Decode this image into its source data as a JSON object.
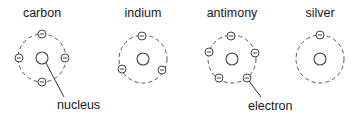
{
  "atoms": [
    {
      "name": "carbon",
      "label_x": 42,
      "cx": 42,
      "cy": 58,
      "r": 24,
      "electrons": [
        [
          42,
          34
        ],
        [
          19,
          58
        ],
        [
          65,
          58
        ],
        [
          42,
          82
        ]
      ]
    },
    {
      "name": "indium",
      "label_x": 143,
      "cx": 143,
      "cy": 59,
      "r": 24,
      "electrons": [
        [
          142,
          36
        ],
        [
          122,
          69
        ],
        [
          162,
          70
        ]
      ]
    },
    {
      "name": "antimony",
      "label_x": 232,
      "cx": 232,
      "cy": 59,
      "r": 24,
      "electrons": [
        [
          231,
          36
        ],
        [
          209,
          52
        ],
        [
          255,
          53
        ],
        [
          219,
          78
        ],
        [
          247,
          78
        ]
      ]
    },
    {
      "name": "silver",
      "label_x": 320,
      "cx": 320,
      "cy": 59,
      "r": 24,
      "electrons": [
        [
          320,
          35
        ]
      ]
    }
  ],
  "callouts": {
    "nucleus": {
      "text": "nucleus",
      "x": 57,
      "y": 109,
      "line": [
        46,
        63,
        64,
        97
      ]
    },
    "electron": {
      "text": "electron",
      "x": 248,
      "y": 110,
      "line": [
        249,
        81,
        261,
        97
      ]
    }
  },
  "nucleus_radius": 6,
  "electron_radius": 4
}
